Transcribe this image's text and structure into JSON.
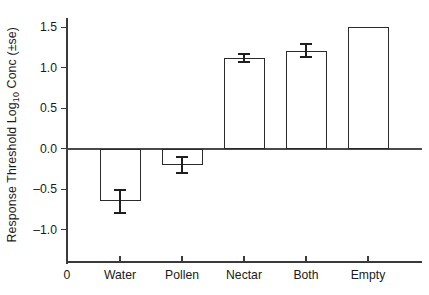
{
  "chart_data": {
    "type": "bar",
    "title": "",
    "xlabel": "",
    "ylabel": "Response Threshold Log10 Conc (±se)",
    "ylabel_parts": {
      "pre": "Response Threshold Log",
      "sub": "10",
      "post": " Conc (±se)"
    },
    "categories": [
      "Water",
      "Pollen",
      "Nectar",
      "Both",
      "Empty"
    ],
    "values": [
      -0.65,
      -0.2,
      1.12,
      1.21,
      1.5
    ],
    "errors": [
      0.14,
      0.1,
      0.05,
      0.08,
      0.0
    ],
    "ylim": [
      -1.35,
      1.62
    ],
    "ytick_values": [
      1.5,
      1.0,
      0.5,
      0.0,
      -0.5,
      -1.0
    ],
    "ytick_labels": [
      "1.5",
      "1.0",
      "0.5",
      "0.0",
      "–0.5",
      "–1.0"
    ],
    "origin_label": "0",
    "grid": false,
    "legend": false,
    "bar_fill": "#ffffff",
    "bar_stroke": "#2b2b2b",
    "axis_color": "#3a3a3a",
    "text_color": "#1a1a1a"
  }
}
